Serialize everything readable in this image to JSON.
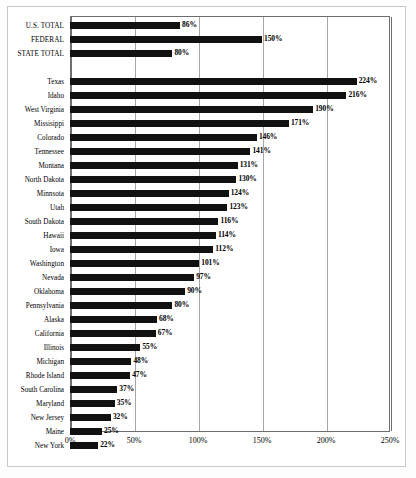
{
  "chart_data": {
    "type": "bar",
    "orientation": "horizontal",
    "title": "",
    "subtitle": "",
    "xlabel": "",
    "ylabel": "",
    "xlim": [
      0,
      250
    ],
    "xticks": [
      "0%",
      "50%",
      "100%",
      "150%",
      "200%",
      "250%"
    ],
    "xtick_values": [
      0,
      50,
      100,
      150,
      200,
      250
    ],
    "grid": true,
    "legend": null,
    "bar_color": "#111111",
    "value_label_suffix": "%",
    "groups": [
      {
        "name": "totals",
        "categories": [
          "U.S. TOTAL",
          "FEDERAL",
          "STATE TOTAL"
        ],
        "values": [
          86,
          150,
          80
        ],
        "labels": [
          "86%",
          "150%",
          "80%"
        ]
      },
      {
        "name": "states",
        "categories": [
          "Texas",
          "Idaho",
          "West Virginia",
          "Missisippi",
          "Colorado",
          "Tennessee",
          "Montana",
          "North Dakota",
          "Minnsota",
          "Utah",
          "South Dakota",
          "Hawaii",
          "Iowa",
          "Washington",
          "Nevada",
          "Oklahoma",
          "Pennsylvania",
          "Alaska",
          "California",
          "Illinois",
          "Michigan",
          "Rhode Island",
          "South Carolina",
          "Maryland",
          "New Jersey",
          "Maine",
          "New York"
        ],
        "values": [
          224,
          216,
          190,
          171,
          146,
          141,
          131,
          130,
          124,
          123,
          116,
          114,
          112,
          101,
          97,
          90,
          80,
          68,
          67,
          55,
          48,
          47,
          37,
          35,
          32,
          25,
          22
        ],
        "labels": [
          "224%",
          "216%",
          "190%",
          "171%",
          "146%",
          "141%",
          "131%",
          "130%",
          "124%",
          "123%",
          "116%",
          "114%",
          "112%",
          "101%",
          "97%",
          "90%",
          "80%",
          "68%",
          "67%",
          "55%",
          "48%",
          "47%",
          "37%",
          "35%",
          "32%",
          "25%",
          "22%"
        ]
      }
    ]
  },
  "colors": {
    "bar": "#111111",
    "gridline": "#a6a6a6",
    "axis": "#6e6e6e",
    "frame": "#c8c8c8",
    "background": "#ffffff",
    "text": "#000000"
  }
}
